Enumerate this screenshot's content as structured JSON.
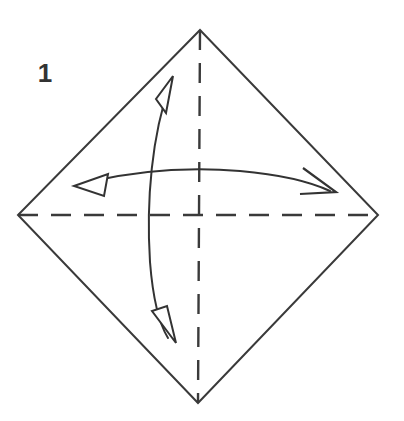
{
  "diagram": {
    "title": "Origami fold step diagram",
    "step_label": "1",
    "background_color": "#ffffff",
    "line_color": "#3a3a3a",
    "dash_color": "#3a3a3a",
    "arrow_color": "#333333",
    "label_color": "#333333",
    "canvas": {
      "width": 404,
      "height": 421
    },
    "shape": {
      "name": "square-rotated-45-diamond",
      "stroke_width": 2,
      "fill": "none",
      "vertices": {
        "top": [
          200,
          30
        ],
        "right": [
          378,
          215
        ],
        "bottom": [
          198,
          403
        ],
        "left": [
          18,
          215
        ]
      }
    },
    "crease_lines": [
      {
        "name": "horizontal-crease",
        "style": "dashed",
        "from": [
          18,
          215
        ],
        "to": [
          378,
          215
        ],
        "dash_length": 20,
        "gap_length": 13
      },
      {
        "name": "vertical-crease",
        "style": "dashed",
        "from": [
          200,
          30
        ],
        "to": [
          198,
          403
        ],
        "dash_length": 20,
        "gap_length": 13
      }
    ],
    "arrows": [
      {
        "name": "vertical-fold-arrow",
        "kind": "double-headed-curved",
        "bulge_direction": "left",
        "head_top": {
          "tip": [
            173,
            76
          ],
          "style": "hollow-triangle",
          "points_toward": "up-right"
        },
        "head_bottom": {
          "tip": [
            175,
            342
          ],
          "style": "hollow-triangle",
          "points_toward": "down-right"
        }
      },
      {
        "name": "horizontal-fold-arrow",
        "kind": "double-headed-curved",
        "bulge_direction": "up",
        "head_left": {
          "tip": [
            75,
            185
          ],
          "style": "hollow-triangle",
          "points_toward": "left"
        },
        "head_right": {
          "tip": [
            335,
            193
          ],
          "style": "open-v",
          "points_toward": "right"
        }
      }
    ]
  }
}
